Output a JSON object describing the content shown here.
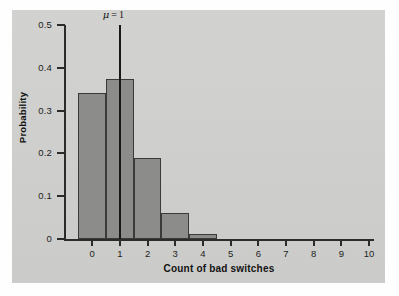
{
  "figure": {
    "background_color": "#cfcfcd",
    "bar_color": "#8c8c8a",
    "axis_color": "#2b2b2b"
  },
  "chart_data": {
    "type": "bar",
    "title": "",
    "xlabel": "Count of bad switches",
    "ylabel": "Probability",
    "categories": [
      "0",
      "1",
      "2",
      "3",
      "4",
      "5",
      "6",
      "7",
      "8",
      "9",
      "10"
    ],
    "values": [
      0.34,
      0.375,
      0.19,
      0.06,
      0.012,
      0.0,
      0.0,
      0.0,
      0.0,
      0.0,
      0.0
    ],
    "xlim": [
      -0.5,
      10.5
    ],
    "ylim": [
      0,
      0.5
    ],
    "ytick_labels": [
      "0.5",
      "0.4",
      "0.3",
      "0.2",
      "0.1",
      "0"
    ],
    "ytick_values": [
      0.5,
      0.4,
      0.3,
      0.2,
      0.1,
      0
    ],
    "xtick_labels": [
      "0",
      "1",
      "2",
      "3",
      "4",
      "5",
      "6",
      "7",
      "8",
      "9",
      "10"
    ],
    "grid": false,
    "legend": "none",
    "annotations": [
      {
        "name": "mean-marker",
        "symbol": "μ",
        "text": "μ = 1",
        "x": 1,
        "y_top": 0.5,
        "y_bottom": 0
      }
    ]
  }
}
